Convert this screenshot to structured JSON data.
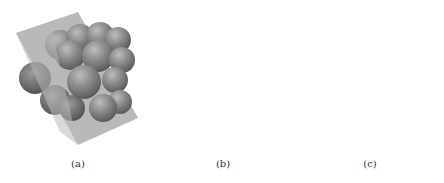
{
  "figure": {
    "panels": [
      {
        "id": "a",
        "caption": "(a)",
        "description": "3D cluster of spheres intersected by a tilted semi-transparent plane"
      },
      {
        "id": "b",
        "caption": "(b)",
        "description": "Spheres cut by plane, showing circular cross-sections on the plane"
      },
      {
        "id": "c",
        "caption": "(c)",
        "description": "2D cross-section view with two dark circles and faint outlines"
      }
    ],
    "colors": {
      "background": "#ffffff",
      "plane": "#b8b8b8",
      "sphere": "#8a8a8a",
      "sphere_dark": "#5e5e5e",
      "section_fill": "#a6a6a6",
      "section_dark": "#7e7e7e",
      "square_bg": "#a9a9a9",
      "circle_dark": "#7c7c7c"
    }
  }
}
